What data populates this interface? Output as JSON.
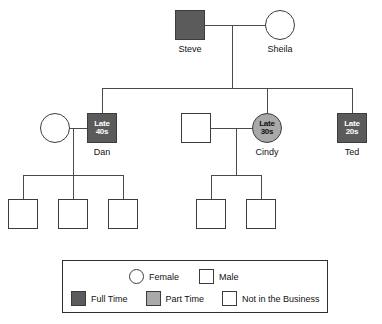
{
  "diagram": {
    "colors": {
      "full_time": "#5b5b5b",
      "part_time": "#a9a9a9",
      "not_in_business": "#ffffff",
      "line": "#4a4a4a",
      "border": "#3c3c3c"
    },
    "generation1": [
      {
        "id": "steve",
        "name": "Steve",
        "gender": "male",
        "shape": "square",
        "status": "full_time",
        "age": ""
      },
      {
        "id": "sheila",
        "name": "Sheila",
        "gender": "female",
        "shape": "circle",
        "status": "not_in_business",
        "age": ""
      }
    ],
    "generation2": [
      {
        "id": "dan-spouse",
        "name": "",
        "gender": "female",
        "shape": "circle",
        "status": "not_in_business",
        "age": ""
      },
      {
        "id": "dan",
        "name": "Dan",
        "gender": "male",
        "shape": "square",
        "status": "full_time",
        "age_line1": "Late",
        "age_line2": "40s"
      },
      {
        "id": "cindy-spouse",
        "name": "",
        "gender": "male",
        "shape": "square",
        "status": "not_in_business",
        "age": ""
      },
      {
        "id": "cindy",
        "name": "Cindy",
        "gender": "female",
        "shape": "circle",
        "status": "part_time",
        "age_line1": "Late",
        "age_line2": "30s"
      },
      {
        "id": "ted",
        "name": "Ted",
        "gender": "male",
        "shape": "square",
        "status": "full_time",
        "age_line1": "Late",
        "age_line2": "20s"
      }
    ],
    "generation3": [
      {
        "id": "dan-child-1",
        "name": "",
        "gender": "male",
        "shape": "square",
        "status": "not_in_business"
      },
      {
        "id": "dan-child-2",
        "name": "",
        "gender": "male",
        "shape": "square",
        "status": "not_in_business"
      },
      {
        "id": "dan-child-3",
        "name": "",
        "gender": "male",
        "shape": "square",
        "status": "not_in_business"
      },
      {
        "id": "cindy-child-1",
        "name": "",
        "gender": "male",
        "shape": "square",
        "status": "not_in_business"
      },
      {
        "id": "cindy-child-2",
        "name": "",
        "gender": "male",
        "shape": "square",
        "status": "not_in_business"
      }
    ]
  },
  "legend": {
    "gender_row": [
      {
        "key": "female",
        "shape": "circle",
        "fill": "not_in_business",
        "label": "Female"
      },
      {
        "key": "male",
        "shape": "square",
        "fill": "not_in_business",
        "label": "Male"
      }
    ],
    "status_row": [
      {
        "key": "full-time",
        "shape": "square",
        "fill": "full_time",
        "label": "Full Time"
      },
      {
        "key": "part-time",
        "shape": "square",
        "fill": "part_time",
        "label": "Part Time"
      },
      {
        "key": "not-in-business",
        "shape": "square",
        "fill": "not_in_business",
        "label": "Not in the Business"
      }
    ]
  }
}
